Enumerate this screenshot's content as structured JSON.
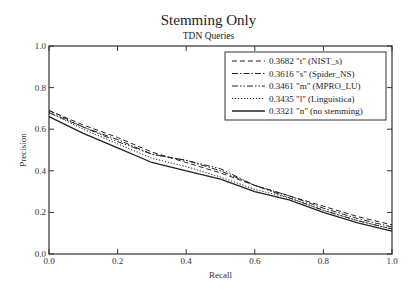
{
  "chart_data": {
    "type": "line",
    "title": "Stemming Only",
    "subtitle": "TDN Queries",
    "xlabel": "Recall",
    "ylabel": "Precision",
    "xlim": [
      0.0,
      1.0
    ],
    "ylim": [
      0.0,
      1.0
    ],
    "xticks": [
      "0.0",
      "0.2",
      "0.4",
      "0.6",
      "0.8",
      "1.0"
    ],
    "yticks": [
      "0.0",
      "0.2",
      "0.4",
      "0.6",
      "0.8",
      "1.0"
    ],
    "grid": false,
    "legend_position": "upper right",
    "x": [
      0.0,
      0.1,
      0.2,
      0.3,
      0.4,
      0.5,
      0.6,
      0.7,
      0.8,
      0.9,
      1.0
    ],
    "series": [
      {
        "name": "0.3682 \"t\" (NIST_s)",
        "style": "dashed",
        "values": [
          0.69,
          0.62,
          0.56,
          0.49,
          0.44,
          0.39,
          0.33,
          0.28,
          0.23,
          0.18,
          0.14
        ]
      },
      {
        "name": "0.3616 \"s\" (Spider_NS)",
        "style": "dashdot",
        "values": [
          0.68,
          0.61,
          0.55,
          0.48,
          0.45,
          0.4,
          0.33,
          0.28,
          0.22,
          0.17,
          0.13
        ]
      },
      {
        "name": "0.3461 \"m\" (MPRO_LU)",
        "style": "dashdotdot",
        "values": [
          0.69,
          0.61,
          0.54,
          0.48,
          0.45,
          0.41,
          0.33,
          0.27,
          0.21,
          0.16,
          0.12
        ]
      },
      {
        "name": "0.3435 \"l\" (Linguistica)",
        "style": "dotted",
        "values": [
          0.68,
          0.6,
          0.53,
          0.46,
          0.42,
          0.37,
          0.31,
          0.27,
          0.21,
          0.16,
          0.12
        ]
      },
      {
        "name": "0.3321 \"n\" (no stemming)",
        "style": "solid",
        "values": [
          0.66,
          0.58,
          0.51,
          0.44,
          0.4,
          0.36,
          0.3,
          0.26,
          0.2,
          0.15,
          0.11
        ]
      }
    ]
  }
}
